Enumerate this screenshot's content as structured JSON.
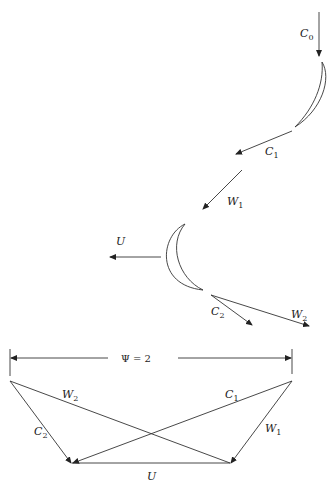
{
  "diagram": {
    "labels": {
      "c0": {
        "main": "C",
        "sub": "0"
      },
      "c1": {
        "main": "C",
        "sub": "1"
      },
      "w1": {
        "main": "W",
        "sub": "1"
      },
      "u_blade": {
        "main": "U",
        "sub": ""
      },
      "c2": {
        "main": "C",
        "sub": "2"
      },
      "w2": {
        "main": "W",
        "sub": "2"
      },
      "psi": "Ψ = 2",
      "tri_w2": {
        "main": "W",
        "sub": "2"
      },
      "tri_c1": {
        "main": "C",
        "sub": "1"
      },
      "tri_c2": {
        "main": "C",
        "sub": "2"
      },
      "tri_w1": {
        "main": "W",
        "sub": "1"
      },
      "tri_u": {
        "main": "U",
        "sub": ""
      }
    },
    "colors": {
      "stroke": "#333333",
      "background": "#ffffff"
    }
  }
}
